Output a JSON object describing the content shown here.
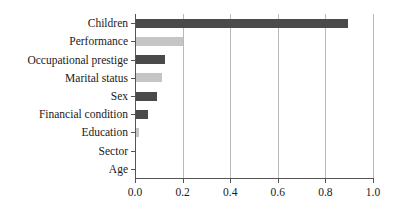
{
  "chart_data": {
    "type": "bar",
    "orientation": "horizontal",
    "title": "",
    "subtitle": "",
    "xlabel": "",
    "ylabel": "",
    "categories": [
      "Children",
      "Performance",
      "Occupational prestige",
      "Marital status",
      "Sex",
      "Financial condition",
      "Education",
      "Sector",
      "Age"
    ],
    "values": [
      0.895,
      0.202,
      0.125,
      0.112,
      0.091,
      0.055,
      0.017,
      0.0,
      0.0
    ],
    "bar_colors": [
      "#4a4a4a",
      "#c5c5c5",
      "#4a4a4a",
      "#c5c5c5",
      "#4a4a4a",
      "#4a4a4a",
      "#c5c5c5",
      "#4a4a4a",
      "#c5c5c5"
    ],
    "xlim": [
      0.0,
      1.0
    ],
    "xticks": [
      0.0,
      0.2,
      0.4,
      0.6,
      0.8,
      1.0
    ],
    "xtick_labels": [
      "0.0",
      "0.2",
      "0.4",
      "0.6",
      "0.8",
      "1.0"
    ],
    "grid": true,
    "grid_axis": "x",
    "legend": false,
    "legend_position": "none"
  },
  "style": {
    "background": "#ffffff",
    "axis_color": "#555555",
    "grid_color": "#b9b9b9",
    "text_color": "#1a1a1a",
    "dark_bar": "#4a4a4a",
    "light_bar": "#c5c5c5"
  }
}
